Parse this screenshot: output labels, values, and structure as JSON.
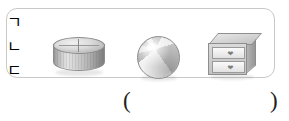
{
  "question": {
    "object_box": {
      "items": [
        {
          "label": "ㄱ",
          "name": "cylinder-object",
          "description": "cylinder"
        },
        {
          "label": "ㄴ",
          "name": "sphere-object",
          "description": "beach ball sphere"
        },
        {
          "label": "ㄷ",
          "name": "cabinet-object",
          "description": "two drawer cabinet"
        }
      ]
    },
    "answer_blank": {
      "open_paren": "(",
      "close_paren": ")",
      "value": ""
    }
  },
  "colors": {
    "box_border": "#c9c9c9",
    "label_border": "#6f6f6f",
    "object_gray": "#bdbdbd",
    "text": "#222222"
  }
}
